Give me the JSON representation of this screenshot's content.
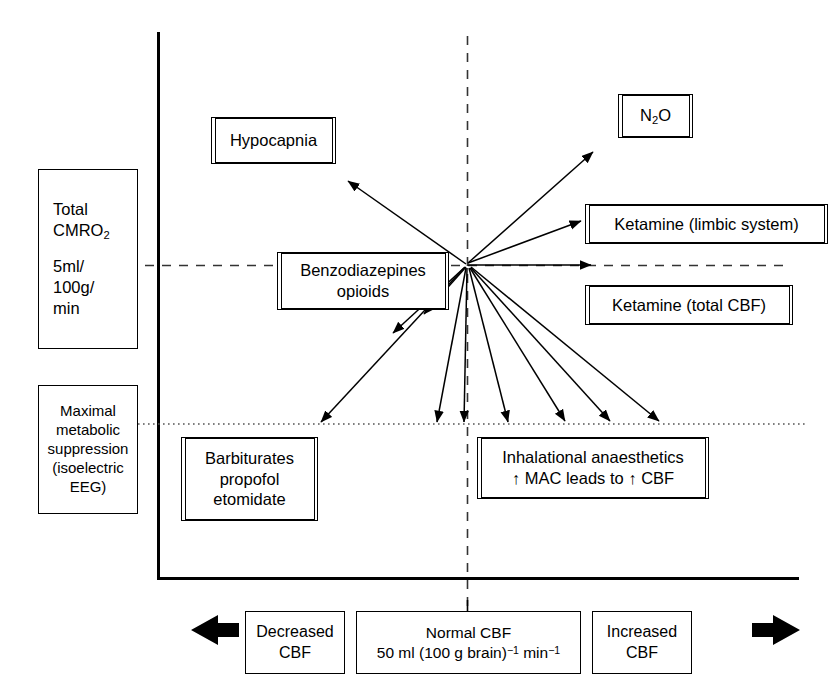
{
  "diagram": {
    "axes": {
      "y_axis_name": "Total CMRO2 (cerebral metabolic rate of oxygen)",
      "x_axis_name": "Cerebral blood flow (CBF)",
      "vertical_reference_line": "normal CBF dashed line",
      "horizontal_reference_line_upper": "normal CMRO2 dashed line",
      "horizontal_reference_line_lower": "maximal metabolic suppression dotted line"
    },
    "y_axis_boxes": [
      {
        "id": "total-cmro2",
        "lines": [
          "Total",
          "CMRO₂",
          "",
          "5ml/",
          "100g/",
          "min"
        ],
        "line1": "Total",
        "line2_prefix": "CMRO",
        "line2_sub": "2",
        "line3": "5ml/",
        "line4": "100g/",
        "line5": "min"
      },
      {
        "id": "maximal-metabolic-suppression",
        "lines": [
          "Maximal",
          "metabolic",
          "suppression",
          "(isoelectric",
          "EEG)"
        ]
      }
    ],
    "plot_boxes": [
      {
        "id": "hypocapnia",
        "label": "Hypocapnia",
        "double_border": true
      },
      {
        "id": "n2o",
        "label_prefix": "N",
        "label_sub": "2",
        "label_suffix": "O",
        "double_border": true
      },
      {
        "id": "ketamine-limbic",
        "label": "Ketamine (limbic system)",
        "double_border": true
      },
      {
        "id": "ketamine-total-cbf",
        "label": "Ketamine (total CBF)",
        "double_border": true
      },
      {
        "id": "benzodiazepines-opioids",
        "line1": "Benzodiazepines",
        "line2": "opioids",
        "double_border": true
      },
      {
        "id": "barbiturates",
        "line1": "Barbiturates",
        "line2": "propofol",
        "line3": "etomidate",
        "double_border": true
      },
      {
        "id": "inhalational",
        "line1": "Inhalational anaesthetics",
        "line2": "↑ MAC leads to ↑ CBF",
        "double_border": true
      }
    ],
    "bottom_scale": {
      "left_arrow": "left-arrow",
      "right_arrow": "right-arrow",
      "decreased": {
        "line1": "Decreased",
        "line2": "CBF"
      },
      "normal": {
        "line1": "Normal CBF",
        "line2_a": "50 ml (100 g brain)",
        "line2_sup1": "−1",
        "line2_b": " min",
        "line2_sup2": "−1"
      },
      "increased": {
        "line1": "Increased",
        "line2": "CBF"
      }
    },
    "arrows": {
      "count": 12,
      "origin": {
        "x": 467,
        "y": 265
      },
      "description": "Vectors radiating from the normal CBF / normal CMRO2 origin showing direction of change for each agent",
      "targets": [
        {
          "to": "hypocapnia",
          "dx": -119,
          "dy": -83,
          "direction": "up-left"
        },
        {
          "to": "n2o",
          "dx": 126,
          "dy": -112,
          "direction": "up-right"
        },
        {
          "to": "ketamine-limbic",
          "dx": 113,
          "dy": -43,
          "direction": "up-right-shallow"
        },
        {
          "to": "ketamine-total-cbf",
          "dx": 124,
          "dy": 0,
          "direction": "right"
        },
        {
          "to": "benzodiazepines-opioids-upper",
          "dx": -43,
          "dy": 47,
          "direction": "down-left-steep"
        },
        {
          "to": "benzodiazepines-opioids-lower",
          "dx": -74,
          "dy": 66,
          "direction": "down-left"
        },
        {
          "to": "barbiturates-far",
          "dx": -146,
          "dy": 158,
          "direction": "down-left-long"
        },
        {
          "to": "suppression-line-1",
          "dx": -30,
          "dy": 158,
          "direction": "down"
        },
        {
          "to": "suppression-line-2",
          "dx": -3,
          "dy": 158,
          "direction": "down"
        },
        {
          "to": "suppression-line-3",
          "dx": 41,
          "dy": 158,
          "direction": "down-right"
        },
        {
          "to": "suppression-line-4",
          "dx": 98,
          "dy": 158,
          "direction": "down-right"
        },
        {
          "to": "suppression-line-5",
          "dx": 143,
          "dy": 158,
          "direction": "down-right"
        },
        {
          "to": "suppression-line-6",
          "dx": 192,
          "dy": 158,
          "direction": "down-right-long"
        }
      ]
    },
    "colors": {
      "stroke": "#000000",
      "background": "#ffffff"
    }
  }
}
